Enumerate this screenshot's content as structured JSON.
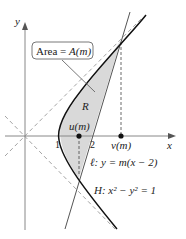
{
  "diagram": {
    "axes": {
      "x_label": "x",
      "y_label": "y",
      "ticks": [
        "1",
        "2"
      ]
    },
    "region_label": "R",
    "callout": {
      "text_prefix": "Area = ",
      "text_func": "A(m)"
    },
    "points": {
      "u": "u(m)",
      "v": "v(m)"
    },
    "line": {
      "name": "ℓ",
      "equation": "ℓ: y = m(x − 2)"
    },
    "hyperbola": {
      "name": "H",
      "equation": "H: x² − y² = 1"
    },
    "colors": {
      "region_fill": "#d9d9d9",
      "curve": "#111111",
      "line": "#555555",
      "axes": "#888888",
      "asymptote": "#999999",
      "callout_border": "#555555"
    }
  }
}
